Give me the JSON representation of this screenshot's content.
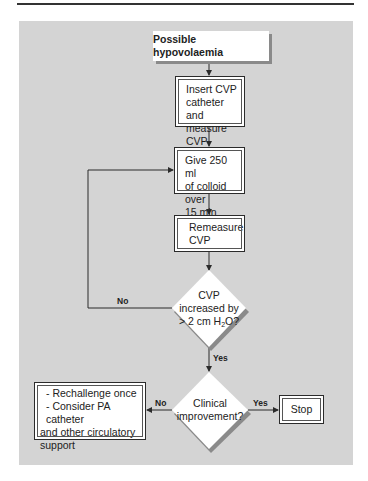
{
  "flowchart": {
    "start": {
      "label": "Possible hypovolaemia"
    },
    "steps": [
      {
        "id": "insert-cvp",
        "lines": [
          "Insert CVP",
          "catheter and",
          "measure CVP"
        ]
      },
      {
        "id": "give-colloid",
        "lines": [
          "Give 250 ml",
          "of colloid over",
          "15 min"
        ]
      },
      {
        "id": "remeasure",
        "lines": [
          "Remeasure",
          "CVP"
        ]
      }
    ],
    "decisions": [
      {
        "id": "cvp-increased",
        "lines": [
          "CVP",
          "increased by",
          "> 2 cm H",
          "2",
          "O?"
        ],
        "no_label": "No",
        "yes_label": "Yes"
      },
      {
        "id": "clinical-improvement",
        "lines": [
          "Clinical",
          "improvement?"
        ],
        "no_label": "No",
        "yes_label": "Yes"
      }
    ],
    "outcomes": {
      "stop": {
        "label": "Stop"
      },
      "escalate": {
        "lines": [
          "- Rechallenge once",
          "- Consider PA catheter",
          "and other circulatory",
          "support"
        ]
      }
    }
  },
  "colors": {
    "panel": "#d4d4d4",
    "box": "#ffffff",
    "line": "#2b2b2b",
    "shadow": "#8a8a8a"
  }
}
